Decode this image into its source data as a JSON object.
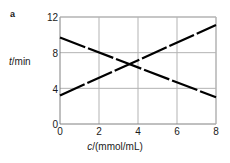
{
  "figure": {
    "panel_label": "a",
    "background_color": "#ffffff",
    "line_color": "#000000",
    "grid_color": "#b3b3b3",
    "axis_color": "#808080",
    "text_color": "#1a1a1a"
  },
  "chart_data": {
    "type": "line",
    "title": "",
    "subtitle": "",
    "panel_label": "a",
    "xlabel": "c/(mmol/mL)",
    "ylabel": "t/min",
    "xlabel_symbol": "c",
    "xlabel_unit": "/(mmol/mL)",
    "ylabel_symbol": "t",
    "ylabel_unit": "/min",
    "xlim": [
      0,
      8
    ],
    "ylim": [
      0,
      12
    ],
    "xticks": [
      0,
      2,
      4,
      6,
      8
    ],
    "yticks": [
      0,
      4,
      8,
      12
    ],
    "xticklabels": [
      "0",
      "2",
      "4",
      "6",
      "8"
    ],
    "yticklabels": [
      "0",
      "4",
      "8",
      "12"
    ],
    "grid": true,
    "grid_style": "solid",
    "legend": false,
    "legend_position": "none",
    "annotations": [],
    "x": [
      0,
      8
    ],
    "series": [
      {
        "name": "descending",
        "x": [
          0,
          8
        ],
        "values": [
          9.7,
          3.0
        ],
        "style": "dashed",
        "color": "#000000",
        "width": 2.2
      },
      {
        "name": "ascending",
        "x": [
          0,
          8
        ],
        "values": [
          3.2,
          11.1
        ],
        "style": "dashed",
        "color": "#000000",
        "width": 2.2
      }
    ],
    "intersection": {
      "x": 3.3,
      "y": 6.45
    }
  }
}
